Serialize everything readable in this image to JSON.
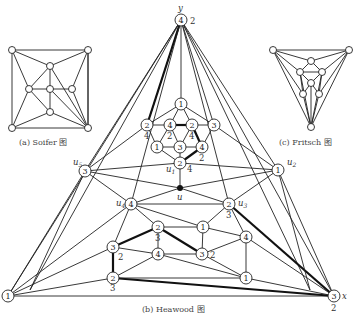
{
  "captions": {
    "a": "(a) Soifer 图",
    "b": "(b) Heawood 图",
    "c": "(c) Fritsch 图"
  },
  "heawood": {
    "vertex_labels": {
      "y": "y",
      "x": "x",
      "u": "u",
      "u1": "u",
      "u1_sub": "1",
      "u2": "u",
      "u2_sub": "2",
      "u3": "u",
      "u3_sub": "3",
      "u4": "u",
      "u4_sub": "4",
      "u5": "u",
      "u5_sub": "5"
    },
    "nodes": {
      "top": "4",
      "top_alt": "2",
      "left": "1",
      "right": "3",
      "right_alt": "2",
      "c1": "1",
      "r1": "2",
      "r1_alt": "4",
      "r2": "4",
      "r2_alt": "2",
      "r3": "2",
      "r3_alt": "4",
      "r4": "3",
      "m1": "1",
      "m2": "3",
      "m3": "4",
      "m3_alt": "2",
      "u1n": "2",
      "u1_alt": "4",
      "u5n": "3",
      "u2n": "1",
      "u4n": "4",
      "u3n": "2",
      "u3_alt": "3",
      "a1": "2",
      "a1_alt": "3",
      "a2": "1",
      "b1": "3",
      "b1_alt": "2",
      "b2": "4",
      "c4": "4",
      "c3": "3",
      "c3_alt": "2",
      "d1": "2",
      "d1_alt": "3",
      "d2": "1"
    }
  }
}
